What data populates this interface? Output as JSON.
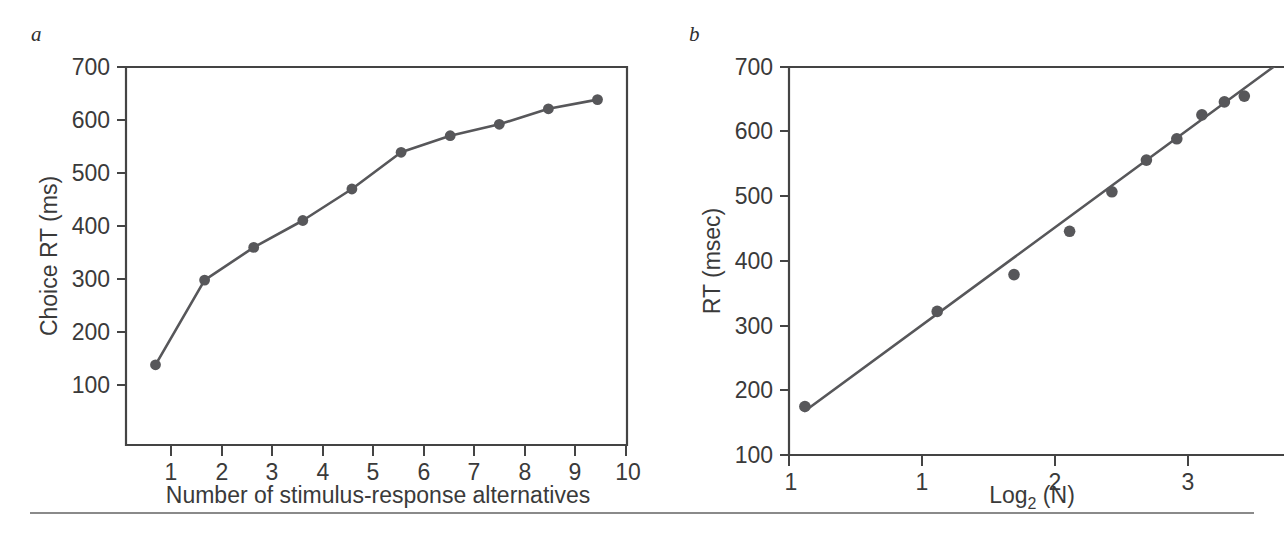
{
  "figure": {
    "background_color": "#ffffff",
    "ink_color": "#57575a",
    "axis_color": "#444444",
    "rule_color": "#8a8a8a"
  },
  "panels": {
    "a": {
      "label": "a"
    },
    "b": {
      "label": "b"
    }
  },
  "chart_data": [
    {
      "type": "line",
      "panel": "a",
      "title": "",
      "xlabel": "Number of stimulus-response alternatives",
      "ylabel": "Choice RT (ms)",
      "x": [
        1,
        2,
        3,
        4,
        5,
        6,
        7,
        8,
        9,
        10
      ],
      "values": [
        180,
        328,
        385,
        432,
        487,
        551,
        580,
        600,
        627,
        643
      ],
      "categories": [
        "1",
        "2",
        "3",
        "4",
        "5",
        "6",
        "7",
        "8",
        "9",
        "10"
      ],
      "xtick_labels": [
        "1",
        "2",
        "3",
        "4",
        "5",
        "6",
        "7",
        "8",
        "9",
        "10"
      ],
      "ytick_labels": [
        "100",
        "200",
        "300",
        "400",
        "500",
        "600",
        "700"
      ],
      "yticks": [
        100,
        200,
        300,
        400,
        500,
        600,
        700
      ],
      "xlim": [
        0.4,
        10.6
      ],
      "ylim": [
        40,
        700
      ],
      "grid": false,
      "legend": "none",
      "markers": "filled-circle",
      "line": true
    },
    {
      "type": "scatter",
      "panel": "b",
      "title": "",
      "xlabel": "Log2 (N)",
      "xlabel_base": "Log",
      "xlabel_subscript": "2",
      "xlabel_tail": " (N)",
      "ylabel": "RT (msec)",
      "x": [
        0,
        1,
        1.58,
        2,
        2.32,
        2.58,
        2.81,
        3.0,
        3.17,
        3.32
      ],
      "values": [
        175,
        322,
        379,
        446,
        507,
        556,
        589,
        626,
        646,
        655
      ],
      "xtick_values": [
        0,
        1,
        2,
        3
      ],
      "xtick_labels": [
        "1",
        "1",
        "2",
        "3"
      ],
      "ytick_labels": [
        "100",
        "200",
        "300",
        "400",
        "500",
        "600",
        "700"
      ],
      "yticks": [
        100,
        200,
        300,
        400,
        500,
        600,
        700
      ],
      "xlim": [
        -0.12,
        3.62
      ],
      "ylim": [
        100,
        700
      ],
      "grid": false,
      "legend": "none",
      "markers": "filled-circle",
      "fit_line": {
        "label": "linear fit",
        "x0": 0,
        "y0": 168,
        "x1": 3.62,
        "y1": 712
      }
    }
  ]
}
